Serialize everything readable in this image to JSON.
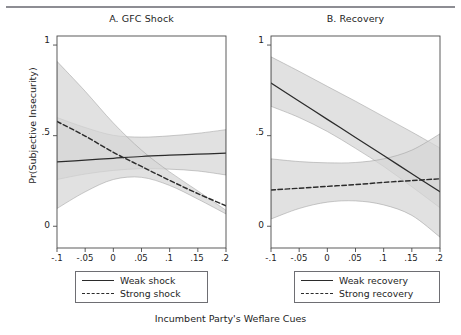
{
  "figure": {
    "xlabel": "Incumbent Party's Weflare Cues",
    "ylabel": "Pr(Subjective Insecurity)",
    "top_rule_color": "#8d8d93"
  },
  "panels": [
    {
      "id": "A",
      "title": "A. GFC Shock",
      "legend": [
        {
          "label": "Weak shock",
          "style": "solid"
        },
        {
          "label": "Strong shock",
          "style": "dashed"
        }
      ]
    },
    {
      "id": "B",
      "title": "B. Recovery",
      "legend": [
        {
          "label": "Weak recovery",
          "style": "solid"
        },
        {
          "label": "Strong recovery",
          "style": "dashed"
        }
      ]
    }
  ],
  "axes": {
    "ytick_labels": [
      "1",
      ".5",
      "0"
    ],
    "ytick_values": [
      1,
      0.5,
      0
    ],
    "xtick_labels": [
      "-.1",
      "-.05",
      "0",
      ".05",
      ".1",
      ".15",
      ".2"
    ],
    "xtick_values": [
      -0.1,
      -0.05,
      0,
      0.05,
      0.1,
      0.15,
      0.2
    ],
    "xlim": [
      -0.1,
      0.2
    ],
    "ylim": [
      -0.12,
      1.05
    ],
    "grid": false
  },
  "colors": {
    "line": "#2b2b2b",
    "band_light": "#d5d5d5",
    "band_mid": "#c2c2c2",
    "band_dark": "#a0a0a0",
    "axis": "#4a4a4a",
    "text": "#242424"
  },
  "chart_data": {
    "type": "line",
    "xlabel": "Incumbent Party's Weflare Cues",
    "ylabel": "Pr(Subjective Insecurity)",
    "xlim": [
      -0.1,
      0.2
    ],
    "ylim": [
      -0.12,
      1.05
    ],
    "grid": false,
    "legend_position": "below-each-panel",
    "x": [
      -0.1,
      -0.05,
      0,
      0.05,
      0.1,
      0.15,
      0.2
    ],
    "panels": [
      {
        "id": "A",
        "title": "A. GFC Shock",
        "series": [
          {
            "name": "Weak shock",
            "style": "solid",
            "values": [
              0.355,
              0.365,
              0.375,
              0.385,
              0.392,
              0.398,
              0.403
            ],
            "ci_lower": [
              0.258,
              0.288,
              0.308,
              0.318,
              0.315,
              0.305,
              0.283
            ],
            "ci_upper": [
              0.6,
              0.545,
              0.502,
              0.492,
              0.499,
              0.513,
              0.533
            ]
          },
          {
            "name": "Strong shock",
            "style": "dashed",
            "values": [
              0.578,
              0.498,
              0.408,
              0.33,
              0.253,
              0.18,
              0.113
            ],
            "ci_lower": [
              0.098,
              0.19,
              0.258,
              0.27,
              0.225,
              0.15,
              0.068
            ],
            "ci_upper": [
              0.91,
              0.745,
              0.57,
              0.42,
              0.3,
              0.195,
              0.088
            ]
          }
        ]
      },
      {
        "id": "B",
        "title": "B. Recovery",
        "series": [
          {
            "name": "Weak recovery",
            "style": "solid",
            "values": [
              0.79,
              0.69,
              0.59,
              0.49,
              0.39,
              0.29,
              0.19
            ],
            "ci_lower": [
              0.662,
              0.6,
              0.523,
              0.43,
              0.33,
              0.218,
              0.102
            ],
            "ci_upper": [
              0.935,
              0.855,
              0.772,
              0.69,
              0.605,
              0.52,
              0.432
            ]
          },
          {
            "name": "Strong recovery",
            "style": "dashed",
            "values": [
              0.2,
              0.21,
              0.22,
              0.23,
              0.242,
              0.252,
              0.262
            ],
            "ci_lower": [
              0.04,
              0.098,
              0.133,
              0.14,
              0.118,
              0.06,
              -0.06
            ],
            "ci_upper": [
              0.372,
              0.357,
              0.35,
              0.352,
              0.372,
              0.42,
              0.51
            ]
          }
        ]
      }
    ]
  }
}
